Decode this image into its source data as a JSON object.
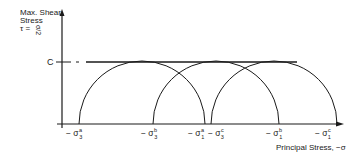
{
  "y_axis": {
    "label_line1": "Max. Shear",
    "label_line2": "Stress",
    "label_line3": "τ = σ/2",
    "tau_symbol": "τ =",
    "fraction": "σ/2"
  },
  "x_axis": {
    "label": "Principal Stress, −σ"
  },
  "c_label": "C",
  "tick_labels": [
    {
      "prefix": "− σ",
      "sup": "a",
      "sub": "3"
    },
    {
      "prefix": "− σ",
      "sup": "b",
      "sub": "3"
    },
    {
      "prefix": "− σ",
      "sup": "a",
      "sub": "1"
    },
    {
      "prefix": "− σ",
      "sup": "c",
      "sub": "3"
    },
    {
      "prefix": "− σ",
      "sup": "b",
      "sub": "1"
    },
    {
      "prefix": "− σ",
      "sup": "c",
      "sub": "1"
    }
  ],
  "circles": [
    {
      "name": "a",
      "left": "−σ3a",
      "right": "−σ1a"
    },
    {
      "name": "b",
      "left": "−σ3b",
      "right": "−σ1b"
    },
    {
      "name": "c",
      "left": "−σ3c",
      "right": "−σ1c"
    }
  ],
  "colors": {
    "ink": "#1a1a1a",
    "background": "#ffffff"
  }
}
